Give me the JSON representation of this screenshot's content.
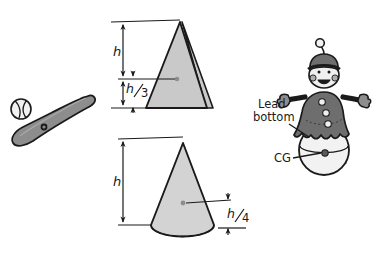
{
  "figure": {
    "background_color": "#ffffff",
    "stroke_color": "#1a1a1a",
    "fill_light_gray": "#c9c9c9",
    "fill_mid_gray": "#8d8d8d",
    "fill_dark_gray": "#6e6e6e",
    "fill_white": "#f2f2f2"
  },
  "objects": {
    "baseball": {
      "name": "baseball",
      "label": ""
    },
    "bat": {
      "name": "baseball-bat",
      "label": "",
      "cg_marker": "cg-dot"
    },
    "triangle": {
      "name": "pyramid",
      "cg_marker": "cg-dot",
      "dimensions": [
        {
          "id": "h",
          "label": "h"
        },
        {
          "id": "h3",
          "label": "h",
          "denominator": "3",
          "display": "h/3"
        }
      ]
    },
    "cone": {
      "name": "cone",
      "cg_marker": "cg-dot",
      "dimensions": [
        {
          "id": "h",
          "label": "h"
        },
        {
          "id": "h4",
          "label": "h",
          "denominator": "4",
          "display": "h/4"
        }
      ]
    },
    "doll": {
      "name": "roly-poly-doll",
      "callouts": [
        {
          "id": "lead-bottom",
          "line1": "Lead",
          "line2": "bottom"
        },
        {
          "id": "cg",
          "text": "CG"
        }
      ]
    }
  },
  "labels": {
    "triangle_h": "h",
    "triangle_frac_num": "h",
    "triangle_frac_den": "3",
    "cone_h": "h",
    "cone_frac_num": "h",
    "cone_frac_den": "4",
    "lead_line1": "Lead",
    "lead_line2": "bottom",
    "cg": "CG"
  }
}
